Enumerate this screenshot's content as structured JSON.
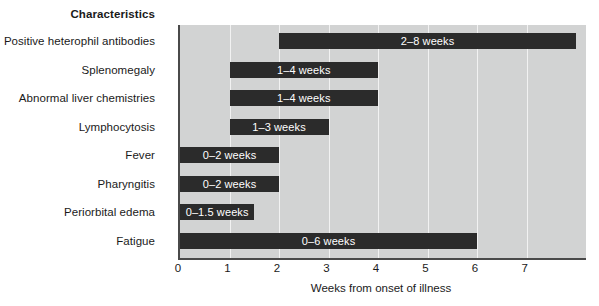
{
  "chart_data": {
    "type": "bar",
    "orientation": "horizontal",
    "title": "",
    "column_header": "Characteristics",
    "xlabel": "Weeks from onset of illness",
    "ylabel": "",
    "xlim": [
      0,
      8.2
    ],
    "grid": true,
    "legend": "none",
    "xticks": [
      {
        "value": 0,
        "label": "0"
      },
      {
        "value": 1,
        "label": "1"
      },
      {
        "value": 2,
        "label": "2"
      },
      {
        "value": 3,
        "label": "3"
      },
      {
        "value": 4,
        "label": "4"
      },
      {
        "value": 5,
        "label": "5"
      },
      {
        "value": 6,
        "label": "6"
      },
      {
        "value": 7,
        "label": "7"
      }
    ],
    "categories": [
      "Positive heterophil antibodies",
      "Splenomegaly",
      "Abnormal liver chemistries",
      "Lymphocytosis",
      "Fever",
      "Pharyngitis",
      "Periorbital edema",
      "Fatigue"
    ],
    "bars": [
      {
        "category": "Positive heterophil antibodies",
        "start": 2,
        "end": 8,
        "label": "2–8 weeks"
      },
      {
        "category": "Splenomegaly",
        "start": 1,
        "end": 4,
        "label": "1–4 weeks"
      },
      {
        "category": "Abnormal liver chemistries",
        "start": 1,
        "end": 4,
        "label": "1–4 weeks"
      },
      {
        "category": "Lymphocytosis",
        "start": 1,
        "end": 3,
        "label": "1–3 weeks"
      },
      {
        "category": "Fever",
        "start": 0,
        "end": 2,
        "label": "0–2 weeks"
      },
      {
        "category": "Pharyngitis",
        "start": 0,
        "end": 2,
        "label": "0–2 weeks"
      },
      {
        "category": "Periorbital edema",
        "start": 0,
        "end": 1.5,
        "label": "0–1.5 weeks"
      },
      {
        "category": "Fatigue",
        "start": 0,
        "end": 6,
        "label": "0–6 weeks"
      }
    ],
    "colors": {
      "bar": "#2b2b2b",
      "plot_background": "#d2d3d3",
      "gridline": "#f2f2f2",
      "axis": "#4a4a4a",
      "bar_text": "#ffffff",
      "text": "#1a1a1a",
      "page_background": "#ffffff"
    }
  }
}
